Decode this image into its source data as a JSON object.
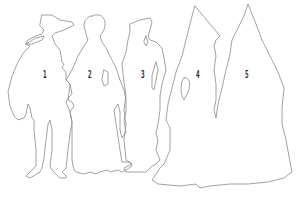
{
  "diagram": {
    "type": "figure-outlines",
    "stroke_color": "#8a8a8a",
    "background": "#ffffff",
    "figures": [
      {
        "id": 1,
        "label": "1",
        "description": "man with wide-brimmed hat and cloak"
      },
      {
        "id": 2,
        "label": "2",
        "description": "figure with round head in long gown"
      },
      {
        "id": 3,
        "label": "3",
        "description": "woman in headdress with long gown"
      },
      {
        "id": 4,
        "label": "4",
        "description": "tall pointed hennin figure"
      },
      {
        "id": 5,
        "label": "5",
        "description": "tall pointed hennin figure with wide train"
      }
    ]
  }
}
